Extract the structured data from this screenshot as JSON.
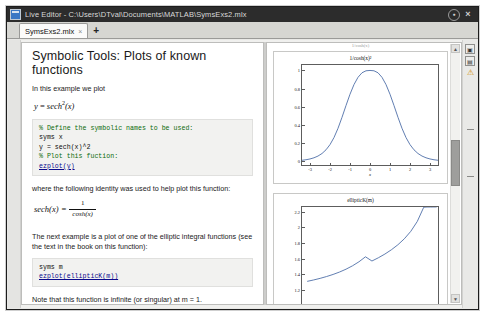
{
  "window": {
    "title": "Live Editor - C:\\Users\\DTval\\Documents\\MATLAB\\SymsExs2.mlx",
    "app_icon": "matlab-live-editor-icon",
    "dock_label": "●",
    "close_label": "×"
  },
  "tabs": {
    "items": [
      {
        "label": "SymsExs2.mlx",
        "close": "×"
      }
    ],
    "add_label": "+"
  },
  "document": {
    "heading": "Symbolic Tools: Plots of known functions",
    "intro": "In this example we plot",
    "equation1": {
      "lhs": "y",
      "rel": "=",
      "fn": "sech",
      "arg": "(x)",
      "power": "2"
    },
    "code1": [
      "% Define the symbolic names to be used:",
      "syms x",
      "y = sech(x)^2",
      "% Plot this fuction:",
      "ezplot(y)"
    ],
    "identity_intro": "where the following identity was used to help plot this function:",
    "identity": {
      "lhs": "sech(x)",
      "rel": "=",
      "numerator": "1",
      "denominator": "cosh(x)"
    },
    "next_example": "The next example is a plot of one of the elliptic integral functions (see the text in the book on this function):",
    "code2": [
      "syms m",
      "ezplot(ellipticK(m))"
    ],
    "note": "Note that this function is infinite (or singular) at m = 1."
  },
  "output": {
    "header_ghost": "1/cosh(x)",
    "scrollbar": {
      "up": "▲",
      "down": "▼"
    }
  },
  "rail": {
    "buttons": [
      {
        "name": "output-inline-icon",
        "glyph": "▣"
      },
      {
        "name": "output-right-icon",
        "glyph": "▤"
      }
    ],
    "warning_glyph": "⚠"
  },
  "chart_data": [
    {
      "type": "line",
      "title": "1/cosh(x)²",
      "xlabel": "x",
      "ylabel": "",
      "xlim": [
        -3.4,
        3.4
      ],
      "ylim": [
        -0.04,
        1.06
      ],
      "xticks": [
        -3,
        -2,
        -1,
        0,
        1,
        2,
        3
      ],
      "xticklabels": [
        "-3",
        "-2",
        "-1",
        "0",
        "1",
        "2",
        "3"
      ],
      "yticks": [
        0,
        0.2,
        0.4,
        0.6,
        0.8,
        1
      ],
      "yticklabels": [
        "0",
        "0.2",
        "0.4",
        "0.6",
        "0.8",
        "1"
      ],
      "grid": false,
      "legend": null,
      "series": [
        {
          "name": "sech(x)^2",
          "color": "#4f6fa8",
          "x": [
            -3.4,
            -3.2,
            -3.0,
            -2.8,
            -2.6,
            -2.4,
            -2.2,
            -2.0,
            -1.8,
            -1.6,
            -1.4,
            -1.2,
            -1.0,
            -0.8,
            -0.6,
            -0.4,
            -0.2,
            0.0,
            0.2,
            0.4,
            0.6,
            0.8,
            1.0,
            1.2,
            1.4,
            1.6,
            1.8,
            2.0,
            2.2,
            2.4,
            2.6,
            2.8,
            3.0,
            3.2,
            3.4
          ],
          "y": [
            0.0089,
            0.0133,
            0.0198,
            0.0295,
            0.0438,
            0.0648,
            0.0952,
            0.1381,
            0.1966,
            0.2724,
            0.363,
            0.4601,
            0.5537,
            0.6338,
            0.6935,
            0.7308,
            0.7472,
            0.75,
            0.7472,
            0.7308,
            0.6935,
            0.6338,
            0.5537,
            0.4601,
            0.363,
            0.2724,
            0.1966,
            0.1381,
            0.0952,
            0.0648,
            0.0438,
            0.0295,
            0.0198,
            0.0133,
            0.0089
          ]
        }
      ],
      "note": "y values plotted normalized so peak reaches 1 at x = 0"
    },
    {
      "type": "line",
      "title": "ellipticK(m)",
      "xlabel": "m",
      "ylabel": "",
      "xlim": [
        -1.08,
        1.02
      ],
      "ylim": [
        0.92,
        2.26
      ],
      "xticks": [
        -1,
        -0.8,
        -0.6,
        -0.4,
        -0.2,
        0,
        1
      ],
      "xticklabels": [
        "-1",
        "-0.8",
        "-0.6",
        "-0.4",
        "-0.2",
        "0",
        "1"
      ],
      "yticks": [
        1,
        1.2,
        1.4,
        1.6,
        1.8,
        2,
        2.2
      ],
      "yticklabels": [
        "1",
        "1.2",
        "1.4",
        "1.6",
        "1.8",
        "2",
        "2.2"
      ],
      "grid": false,
      "legend": null,
      "series": [
        {
          "name": "ellipticK(m)",
          "color": "#4f6fa8",
          "x": [
            -1.0,
            -0.9,
            -0.8,
            -0.7,
            -0.6,
            -0.5,
            -0.4,
            -0.3,
            -0.2,
            -0.1,
            0.0,
            0.1,
            0.2,
            0.3,
            0.4,
            0.5,
            0.6,
            0.7,
            0.8,
            0.85,
            0.9,
            0.93,
            0.95,
            0.97,
            0.98,
            0.99,
            0.995,
            0.999
          ],
          "y": [
            1.311,
            1.329,
            1.3494,
            1.3726,
            1.3993,
            1.4301,
            1.4664,
            1.5094,
            1.5611,
            1.6243,
            1.5708,
            1.6124,
            1.6596,
            1.7139,
            1.7775,
            1.8541,
            1.9496,
            2.0754,
            2.2572,
            2.3893,
            2.5781,
            2.7278,
            2.8903,
            3.1559,
            3.3541,
            3.6956,
            3.9397,
            4.8957
          ]
        }
      ],
      "note": "curve rises monotonically from ~0.96 at m = -1 to off-scale near m = 1"
    }
  ]
}
